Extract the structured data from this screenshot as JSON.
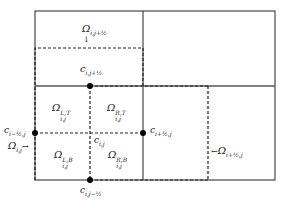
{
  "diagram": {
    "type": "staggered-grid-control-volumes",
    "colors": {
      "line": "#444444",
      "dashed": "#222222",
      "dot": "#000000",
      "text": "#222222"
    },
    "labels": {
      "omega_top": "Ω",
      "omega_top_sub": "i,j+½",
      "c_top": "c",
      "c_top_sub": "i,j+½",
      "omega_LT": "Ω",
      "omega_LT_sup": "L,T",
      "omega_LT_sub": "i,j",
      "omega_RT": "Ω",
      "omega_RT_sup": "R,T",
      "omega_RT_sub": "i,j",
      "omega_LB": "Ω",
      "omega_LB_sup": "L,B",
      "omega_LB_sub": "i,j",
      "omega_RB": "Ω",
      "omega_RB_sup": "R,B",
      "omega_RB_sub": "i,j",
      "c_center": "c",
      "c_center_sub": "i,j",
      "c_left": "c",
      "c_left_sub": "i−½,j",
      "c_right": "c",
      "c_right_sub": "i+½,j",
      "c_bottom": "c",
      "c_bottom_sub": "i,j−½",
      "omega_cell": "Ω",
      "omega_cell_sub": "i,j",
      "omega_cell_arrow": "→",
      "omega_right": "Ω",
      "omega_right_sub": "i+½,j",
      "omega_right_arrow": "←",
      "down_arrow": "↓"
    }
  }
}
